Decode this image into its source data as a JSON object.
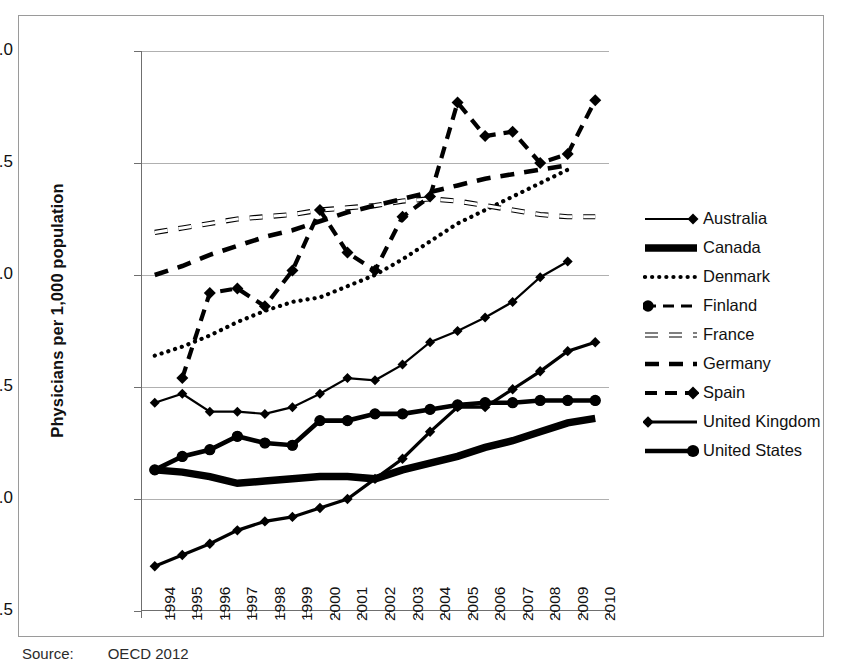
{
  "figure": {
    "source_label": "Source:",
    "source_text": "OECD 2012"
  },
  "chart_data": {
    "type": "line",
    "title": "",
    "xlabel": "",
    "ylabel": "Physicians per 1,000 population",
    "xlim": [
      1994,
      2010
    ],
    "ylim": [
      1.5,
      4.0
    ],
    "ytick_labels": [
      "1.5",
      "2.0",
      "2.5",
      "3.0",
      "3.5",
      "4.0"
    ],
    "ytick_values": [
      1.5,
      2.0,
      2.5,
      3.0,
      3.5,
      4.0
    ],
    "grid": "horizontal",
    "legend_position": "right",
    "categories": [
      1994,
      1995,
      1996,
      1997,
      1998,
      1999,
      2000,
      2001,
      2002,
      2003,
      2004,
      2005,
      2006,
      2007,
      2008,
      2009,
      2010
    ],
    "x": [
      "1994",
      "1995",
      "1996",
      "1997",
      "1998",
      "1999",
      "2000",
      "2001",
      "2002",
      "2003",
      "2004",
      "2005",
      "2006",
      "2007",
      "2008",
      "2009",
      "2010"
    ],
    "series": [
      {
        "name": "Australia",
        "style": "solid-thin-diamond",
        "values": [
          2.43,
          2.47,
          2.39,
          2.39,
          2.38,
          2.41,
          2.47,
          2.54,
          2.53,
          2.6,
          2.7,
          2.75,
          2.81,
          2.88,
          2.99,
          3.06,
          null
        ]
      },
      {
        "name": "Canada",
        "style": "solid-thick",
        "values": [
          2.13,
          2.12,
          2.1,
          2.07,
          2.08,
          2.09,
          2.1,
          2.1,
          2.09,
          2.13,
          2.16,
          2.19,
          2.23,
          2.26,
          2.3,
          2.34,
          2.36
        ]
      },
      {
        "name": "Denmark",
        "style": "dotted",
        "values": [
          2.64,
          2.68,
          2.73,
          2.79,
          2.84,
          2.88,
          2.9,
          2.95,
          3.0,
          3.07,
          3.15,
          3.23,
          3.29,
          3.35,
          3.41,
          3.47,
          null
        ]
      },
      {
        "name": "Finland",
        "style": "dashed-circle",
        "values": [
          2.13,
          2.19,
          2.22,
          2.28,
          2.25,
          2.24,
          2.35,
          2.35,
          2.38,
          2.38,
          2.4,
          2.42,
          2.43,
          2.43,
          2.44,
          2.44,
          2.44
        ]
      },
      {
        "name": "France",
        "style": "dashed-hollow",
        "values": [
          3.19,
          3.21,
          3.23,
          3.25,
          3.26,
          3.27,
          3.29,
          3.3,
          3.31,
          3.33,
          3.34,
          3.33,
          3.31,
          3.29,
          3.27,
          3.26,
          3.26
        ]
      },
      {
        "name": "Germany",
        "style": "dashed-solid",
        "values": [
          3.0,
          3.04,
          3.09,
          3.13,
          3.17,
          3.2,
          3.24,
          3.28,
          3.31,
          3.34,
          3.37,
          3.4,
          3.43,
          3.45,
          3.47,
          3.49,
          null
        ]
      },
      {
        "name": "Spain",
        "style": "dashed-diamond",
        "values": [
          null,
          2.54,
          2.92,
          2.94,
          2.86,
          3.02,
          3.29,
          3.1,
          3.02,
          3.26,
          3.35,
          3.77,
          3.62,
          3.64,
          3.5,
          3.54,
          3.78
        ]
      },
      {
        "name": "United Kingdom",
        "style": "solid-diamond",
        "values": [
          1.7,
          1.75,
          1.8,
          1.86,
          1.9,
          1.92,
          1.96,
          2.0,
          2.09,
          2.18,
          2.3,
          2.41,
          2.41,
          2.49,
          2.57,
          2.66,
          2.7
        ]
      },
      {
        "name": "United States",
        "style": "solid-circle-thick",
        "values": [
          2.13,
          2.19,
          2.22,
          2.28,
          2.25,
          2.24,
          2.35,
          2.35,
          2.38,
          2.38,
          2.4,
          2.42,
          2.43,
          2.43,
          2.44,
          2.44,
          2.44
        ]
      }
    ],
    "legend": [
      {
        "label": "Australia",
        "key": "line-solid-thin-with-diamond-marker"
      },
      {
        "label": "Canada",
        "key": "line-solid-very-thick"
      },
      {
        "label": "Denmark",
        "key": "line-dotted"
      },
      {
        "label": "Finland",
        "key": "line-dashed-with-circle-marker"
      },
      {
        "label": "France",
        "key": "line-dashed-hollow"
      },
      {
        "label": "Germany",
        "key": "line-dashed-solid"
      },
      {
        "label": "Spain",
        "key": "line-dashed-with-diamond-marker"
      },
      {
        "label": "United Kingdom",
        "key": "line-solid-with-diamond-marker"
      },
      {
        "label": "United States",
        "key": "line-solid-with-circle-marker"
      }
    ]
  }
}
